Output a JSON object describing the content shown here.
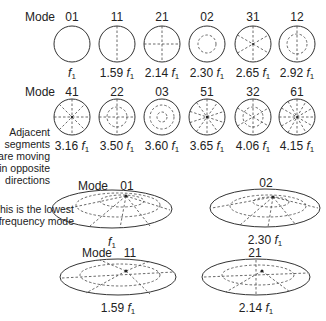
{
  "mode_label": "Mode",
  "freq_symbol": "f",
  "freq_sub": "1",
  "row1": [
    {
      "mode": "01",
      "multiplier": ""
    },
    {
      "mode": "11",
      "multiplier": "1.59"
    },
    {
      "mode": "21",
      "multiplier": "2.14"
    },
    {
      "mode": "02",
      "multiplier": "2.30"
    },
    {
      "mode": "31",
      "multiplier": "2.65"
    },
    {
      "mode": "12",
      "multiplier": "2.92"
    }
  ],
  "row2": [
    {
      "mode": "41",
      "multiplier": "3.16"
    },
    {
      "mode": "22",
      "multiplier": "3.50"
    },
    {
      "mode": "03",
      "multiplier": "3.60"
    },
    {
      "mode": "51",
      "multiplier": "3.65"
    },
    {
      "mode": "32",
      "multiplier": "4.06"
    },
    {
      "mode": "61",
      "multiplier": "4.15"
    }
  ],
  "annotations": {
    "adjacent": [
      "Adjacent",
      "segments",
      "are moving",
      "in opposite",
      "directions"
    ],
    "lowest": [
      "This is the lowest",
      "frequency mode"
    ]
  },
  "perspective": [
    {
      "mode": "01",
      "multiplier": "",
      "show_mode_label": true
    },
    {
      "mode": "02",
      "multiplier": "2.30",
      "show_mode_label": false
    },
    {
      "mode": "11",
      "multiplier": "1.59",
      "show_mode_label": true
    },
    {
      "mode": "21",
      "multiplier": "2.14",
      "show_mode_label": false
    }
  ]
}
